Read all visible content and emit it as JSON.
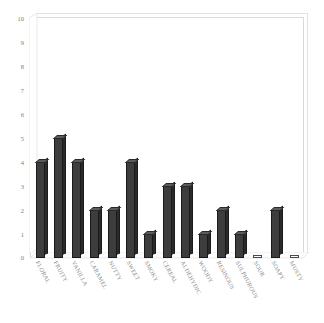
{
  "chart_data": {
    "type": "bar",
    "title": "",
    "subtitle": "",
    "xlabel": "",
    "ylabel": "",
    "ylim": [
      0,
      10
    ],
    "ytick_step": 1,
    "grid": false,
    "legend": "none",
    "style": "3d-column",
    "bar_color": "#3d3d3d",
    "bar_side_color": "#2a2a2a",
    "bar_top_color": "#5c5c5c",
    "frame_color": "#d9d9d9",
    "background": "#ffffff",
    "text_color": "#8a8a8a",
    "categories": [
      "FLORAL",
      "FRUITY",
      "VANILLA",
      "CARAMEL",
      "NUTTY",
      "SWEET",
      "SMOKY",
      "CEREAL",
      "ALDEHYDIC",
      "WOODY",
      "RESINOUS",
      "SULPHUROUS",
      "SOUR",
      "SOAPY",
      "MUSTY"
    ],
    "values": [
      4,
      5,
      4,
      2,
      2,
      4,
      1,
      3,
      3,
      1,
      2,
      1,
      0,
      2,
      0
    ],
    "yticks": [
      "10",
      "9",
      "8",
      "7",
      "6",
      "5",
      "4",
      "3",
      "2",
      "1",
      "0"
    ]
  }
}
